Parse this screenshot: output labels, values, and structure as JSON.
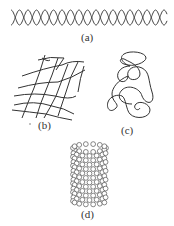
{
  "figure": {
    "panels": [
      {
        "id": "a",
        "label": "(a)",
        "description": "double helix"
      },
      {
        "id": "b",
        "label": "(b)",
        "description": "random network"
      },
      {
        "id": "c",
        "label": "(c)",
        "description": "random coil"
      },
      {
        "id": "d",
        "label": "(d)",
        "description": "cylindrical sphere-packed tube"
      }
    ],
    "colors": {
      "stroke": "#333333",
      "background": "#ffffff"
    }
  }
}
